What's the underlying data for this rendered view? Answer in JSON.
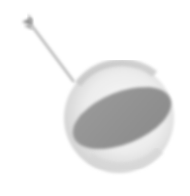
{
  "image": {
    "subject": "sphere-with-arrow",
    "colors": {
      "background": "#ffffff",
      "sphere_light": "#f4f4f4",
      "sphere_mid": "#d8d8d8",
      "sphere_shadow": "#b0b0b0",
      "ellipse_dark": "#8e8e8e",
      "arrow": "#a0a0a0"
    }
  }
}
